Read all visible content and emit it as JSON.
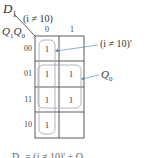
{
  "diagram": {
    "type": "karnaugh-map",
    "output_label": "D",
    "output_subscript": "1",
    "column_variable": "(i ≠ 10)",
    "row_variables": "Q",
    "row_var_sub1": "1",
    "row_var_mid": "Q",
    "row_var_sub0": "0",
    "column_headers": [
      "0",
      "1"
    ],
    "row_headers": [
      "00",
      "01",
      "11",
      "10"
    ],
    "cells": [
      [
        "1",
        ""
      ],
      [
        "1",
        "1"
      ],
      [
        "1",
        "1"
      ],
      [
        "1",
        ""
      ]
    ],
    "groups": [
      {
        "label": "(i ≠ 10)'",
        "covers": "column 0, all rows"
      },
      {
        "label": "Q₀",
        "covers": "rows 01 and 11, both columns"
      }
    ],
    "annotation_group1": "(i ≠ 10)'",
    "annotation_group2_main": "Q",
    "annotation_group2_sub": "0",
    "equation_partial": "D₁ = (i ≠ 10)' + Q₀"
  },
  "colors": {
    "grid": "#333333",
    "group_outline": "#9aa3ad",
    "arrow": "#3a7fc4"
  }
}
